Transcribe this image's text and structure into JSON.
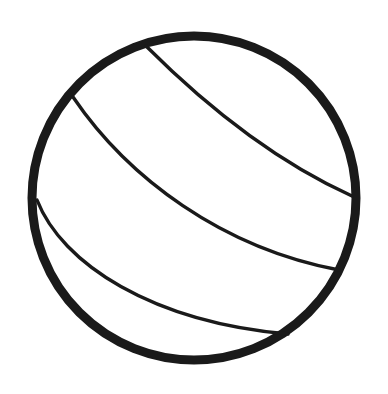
{
  "image": {
    "title": "Volleyball",
    "subject": "volleyball-line-drawing",
    "style": "black outline line art on white background",
    "width": 388,
    "height": 394,
    "background_color": "#ffffff",
    "stroke_color": "#1a1a1a"
  },
  "ball": {
    "outline": {
      "name": "ball-outline-circle",
      "center_x": 194,
      "center_y": 198,
      "radius": 162,
      "stroke_width": 9,
      "stroke_color": "#1a1a1a",
      "fill": "none"
    },
    "seams": [
      {
        "name": "upper-seam",
        "stroke_width": 3.4,
        "stroke_color": "#1a1a1a",
        "start": [
          146,
          46
        ],
        "control_1": [
          196,
          96
        ],
        "control_2": [
          268,
          158
        ],
        "end": [
          352,
          196
        ]
      },
      {
        "name": "middle-seam",
        "stroke_width": 3.4,
        "stroke_color": "#1a1a1a",
        "start": [
          73,
          97
        ],
        "control_1": [
          128,
          178
        ],
        "control_2": [
          222,
          248
        ],
        "end": [
          339,
          270
        ]
      },
      {
        "name": "lower-seam",
        "stroke_width": 3.4,
        "stroke_color": "#1a1a1a",
        "start": [
          37,
          200
        ],
        "control_1": [
          62,
          264
        ],
        "control_2": [
          152,
          322
        ],
        "end": [
          288,
          334
        ]
      }
    ]
  },
  "palette": {
    "ink": "#1a1a1a",
    "paper": "#ffffff"
  }
}
